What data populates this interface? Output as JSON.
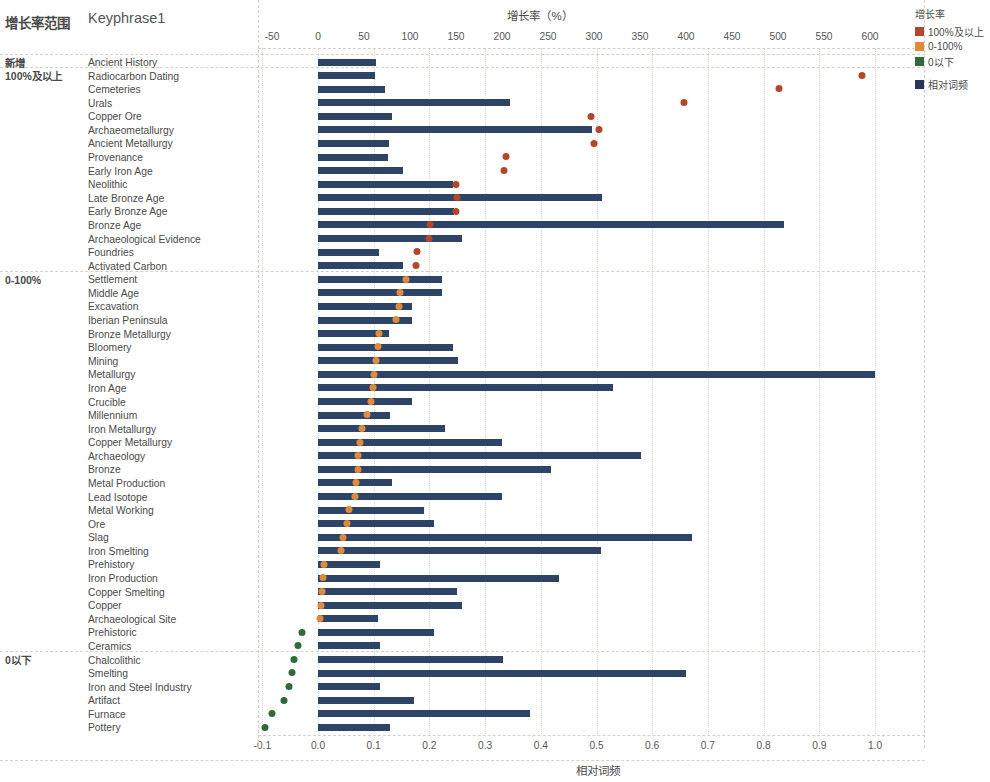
{
  "headers": {
    "group_col": "增长率范围",
    "keyphrase_col": "Keyphrase1"
  },
  "legend": {
    "title": "增长率",
    "items": [
      {
        "label": "100%及以上",
        "color": "#b3472a"
      },
      {
        "label": "0-100%",
        "color": "#e08b3c"
      },
      {
        "label": "0以下",
        "color": "#2f6b3a"
      }
    ],
    "bar_item": {
      "label": "相对词频",
      "color": "#27365a"
    }
  },
  "axes": {
    "top": {
      "title": "增长率（%）",
      "ticks": [
        "-50",
        "0",
        "50",
        "100",
        "150",
        "200",
        "250",
        "300",
        "350",
        "400",
        "450",
        "500",
        "550",
        "600"
      ],
      "min": -50,
      "max": 600
    },
    "bottom": {
      "title": "相对词频",
      "ticks": [
        "-0.1",
        "0.0",
        "0.1",
        "0.2",
        "0.3",
        "0.4",
        "0.5",
        "0.6",
        "0.7",
        "0.8",
        "0.9",
        "1.0"
      ],
      "min": -0.1,
      "max": 1.0
    }
  },
  "groups": [
    {
      "label": "新增",
      "start": 0,
      "count": 1
    },
    {
      "label": "100%及以上",
      "start": 1,
      "count": 15
    },
    {
      "label": "0-100%",
      "start": 16,
      "count": 28
    },
    {
      "label": "0以下",
      "start": 44,
      "count": 8
    }
  ],
  "chart_data": {
    "type": "bar",
    "xlabel": "相对词频",
    "ylabel": "Keyphrase1",
    "top_axis_label": "增长率（%）",
    "xlim": [
      -0.1,
      1.0
    ],
    "top_xlim": [
      -50,
      600
    ],
    "grid": true,
    "legend_position": "right-top",
    "series": [
      {
        "name": "相对词频",
        "type": "bar",
        "color": "#2e4466"
      },
      {
        "name": "增长率",
        "type": "scatter",
        "colors": {
          "100%及以上": "#b3472a",
          "0-100%": "#e08b3c",
          "0以下": "#2f6b3a"
        }
      }
    ],
    "categories": [
      "Ancient History",
      "Radiocarbon Dating",
      "Cemeteries",
      "Urals",
      "Copper Ore",
      "Archaeometallurgy",
      "Ancient Metallurgy",
      "Provenance",
      "Early Iron Age",
      "Neolithic",
      "Late Bronze Age",
      "Early Bronze Age",
      "Bronze Age",
      "Archaeological Evidence",
      "Foundries",
      "Activated Carbon",
      "Settlement",
      "Middle Age",
      "Excavation",
      "Iberian Peninsula",
      "Bronze Metallurgy",
      "Bloomery",
      "Mining",
      "Metallurgy",
      "Iron Age",
      "Crucible",
      "Millennium",
      "Iron Metallurgy",
      "Copper Metallurgy",
      "Archaeology",
      "Bronze",
      "Metal Production",
      "Lead Isotope",
      "Metal Working",
      "Ore",
      "Slag",
      "Iron Smelting",
      "Prehistory",
      "Iron Production",
      "Copper Smelting",
      "Copper",
      "Archaeological Site",
      "Prehistoric",
      "Ceramics",
      "Chalcolithic",
      "Smelting",
      "Iron and Steel Industry",
      "Artifact",
      "Furnace",
      "Pottery"
    ],
    "rows": [
      {
        "keyphrase": "Ancient History",
        "group": "新增",
        "freq": 0.105,
        "growth": null
      },
      {
        "keyphrase": "Radiocarbon Dating",
        "group": "100%及以上",
        "freq": 0.103,
        "growth": 591
      },
      {
        "keyphrase": "Cemeteries",
        "group": "100%及以上",
        "freq": 0.12,
        "growth": 501
      },
      {
        "keyphrase": "Urals",
        "group": "100%及以上",
        "freq": 0.345,
        "growth": 398
      },
      {
        "keyphrase": "Copper Ore",
        "group": "100%及以上",
        "freq": 0.132,
        "growth": 297
      },
      {
        "keyphrase": "Archaeometallurgy",
        "group": "100%及以上",
        "freq": 0.492,
        "growth": 305
      },
      {
        "keyphrase": "Ancient Metallurgy",
        "group": "100%及以上",
        "freq": 0.128,
        "growth": 300
      },
      {
        "keyphrase": "Provenance",
        "group": "100%及以上",
        "freq": 0.126,
        "growth": 204
      },
      {
        "keyphrase": "Early Iron Age",
        "group": "100%及以上",
        "freq": 0.153,
        "growth": 202
      },
      {
        "keyphrase": "Neolithic",
        "group": "100%及以上",
        "freq": 0.242,
        "growth": 150
      },
      {
        "keyphrase": "Late Bronze Age",
        "group": "100%及以上",
        "freq": 0.51,
        "growth": 151
      },
      {
        "keyphrase": "Early Bronze Age",
        "group": "100%及以上",
        "freq": 0.245,
        "growth": 150
      },
      {
        "keyphrase": "Bronze Age",
        "group": "100%及以上",
        "freq": 0.837,
        "growth": 122
      },
      {
        "keyphrase": "Archaeological Evidence",
        "group": "100%及以上",
        "freq": 0.258,
        "growth": 121
      },
      {
        "keyphrase": "Foundries",
        "group": "100%及以上",
        "freq": 0.11,
        "growth": 108
      },
      {
        "keyphrase": "Activated Carbon",
        "group": "100%及以上",
        "freq": 0.152,
        "growth": 107
      },
      {
        "keyphrase": "Settlement",
        "group": "0-100%",
        "freq": 0.222,
        "growth": 96
      },
      {
        "keyphrase": "Middle Age",
        "group": "0-100%",
        "freq": 0.222,
        "growth": 89
      },
      {
        "keyphrase": "Excavation",
        "group": "0-100%",
        "freq": 0.168,
        "growth": 88
      },
      {
        "keyphrase": "Iberian Peninsula",
        "group": "0-100%",
        "freq": 0.168,
        "growth": 85
      },
      {
        "keyphrase": "Bronze Metallurgy",
        "group": "0-100%",
        "freq": 0.128,
        "growth": 66
      },
      {
        "keyphrase": "Bloomery",
        "group": "0-100%",
        "freq": 0.243,
        "growth": 65
      },
      {
        "keyphrase": "Mining",
        "group": "0-100%",
        "freq": 0.252,
        "growth": 63
      },
      {
        "keyphrase": "Metallurgy",
        "group": "0-100%",
        "freq": 1.0,
        "growth": 61
      },
      {
        "keyphrase": "Iron Age",
        "group": "0-100%",
        "freq": 0.53,
        "growth": 60
      },
      {
        "keyphrase": "Crucible",
        "group": "0-100%",
        "freq": 0.168,
        "growth": 58
      },
      {
        "keyphrase": "Millennium",
        "group": "0-100%",
        "freq": 0.13,
        "growth": 53
      },
      {
        "keyphrase": "Iron Metallurgy",
        "group": "0-100%",
        "freq": 0.228,
        "growth": 48
      },
      {
        "keyphrase": "Copper Metallurgy",
        "group": "0-100%",
        "freq": 0.33,
        "growth": 46
      },
      {
        "keyphrase": "Archaeology",
        "group": "0-100%",
        "freq": 0.58,
        "growth": 44
      },
      {
        "keyphrase": "Bronze",
        "group": "0-100%",
        "freq": 0.418,
        "growth": 43
      },
      {
        "keyphrase": "Metal Production",
        "group": "0-100%",
        "freq": 0.132,
        "growth": 41
      },
      {
        "keyphrase": "Lead Isotope",
        "group": "0-100%",
        "freq": 0.33,
        "growth": 40
      },
      {
        "keyphrase": "Metal Working",
        "group": "0-100%",
        "freq": 0.19,
        "growth": 34
      },
      {
        "keyphrase": "Ore",
        "group": "0-100%",
        "freq": 0.208,
        "growth": 32
      },
      {
        "keyphrase": "Slag",
        "group": "0-100%",
        "freq": 0.672,
        "growth": 27
      },
      {
        "keyphrase": "Iron Smelting",
        "group": "0-100%",
        "freq": 0.508,
        "growth": 25
      },
      {
        "keyphrase": "Prehistory",
        "group": "0-100%",
        "freq": 0.112,
        "growth": 6
      },
      {
        "keyphrase": "Iron Production",
        "group": "0-100%",
        "freq": 0.432,
        "growth": 5
      },
      {
        "keyphrase": "Copper Smelting",
        "group": "0-100%",
        "freq": 0.25,
        "growth": 4
      },
      {
        "keyphrase": "Copper",
        "group": "0-100%",
        "freq": 0.258,
        "growth": 3
      },
      {
        "keyphrase": "Archaeological Site",
        "group": "0-100%",
        "freq": 0.108,
        "growth": 2
      },
      {
        "keyphrase": "Prehistoric",
        "group": "0以下",
        "freq": 0.208,
        "growth": -17
      },
      {
        "keyphrase": "Ceramics",
        "group": "0以下",
        "freq": 0.112,
        "growth": -22
      },
      {
        "keyphrase": "Chalcolithic",
        "group": "0以下",
        "freq": 0.332,
        "growth": -26
      },
      {
        "keyphrase": "Smelting",
        "group": "0以下",
        "freq": 0.66,
        "growth": -28
      },
      {
        "keyphrase": "Iron and Steel Industry",
        "group": "0以下",
        "freq": 0.112,
        "growth": -31
      },
      {
        "keyphrase": "Artifact",
        "group": "0以下",
        "freq": 0.172,
        "growth": -37
      },
      {
        "keyphrase": "Furnace",
        "group": "0以下",
        "freq": 0.38,
        "growth": -50
      },
      {
        "keyphrase": "Pottery",
        "group": "0以下",
        "freq": 0.13,
        "growth": -58
      }
    ]
  }
}
